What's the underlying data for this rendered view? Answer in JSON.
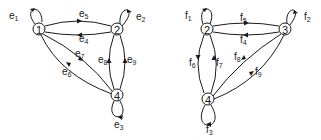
{
  "diagram": {
    "left_graph": {
      "nodes": [
        {
          "id": "1",
          "label": "1"
        },
        {
          "id": "2",
          "label": "2"
        },
        {
          "id": "4",
          "label": "4"
        }
      ],
      "edges": [
        {
          "id": "e1",
          "letter": "e",
          "sub": "1",
          "from": "1",
          "to": "1"
        },
        {
          "id": "e2",
          "letter": "e",
          "sub": "2",
          "from": "2",
          "to": "2"
        },
        {
          "id": "e3",
          "letter": "e",
          "sub": "3",
          "from": "4",
          "to": "4"
        },
        {
          "id": "e4",
          "letter": "e",
          "sub": "4",
          "from": "2",
          "to": "1"
        },
        {
          "id": "e5",
          "letter": "e",
          "sub": "5",
          "from": "1",
          "to": "2"
        },
        {
          "id": "e6",
          "letter": "e",
          "sub": "6",
          "from": "4",
          "to": "1"
        },
        {
          "id": "e7",
          "letter": "e",
          "sub": "7",
          "from": "1",
          "to": "4"
        },
        {
          "id": "e8",
          "letter": "e",
          "sub": "8",
          "from": "4",
          "to": "2"
        },
        {
          "id": "e9",
          "letter": "e",
          "sub": "9",
          "from": "4",
          "to": "2"
        }
      ]
    },
    "right_graph": {
      "nodes": [
        {
          "id": "2",
          "label": "2"
        },
        {
          "id": "3",
          "label": "3"
        },
        {
          "id": "4",
          "label": "4"
        }
      ],
      "edges": [
        {
          "id": "f1",
          "letter": "f",
          "sub": "1",
          "from": "2",
          "to": "2"
        },
        {
          "id": "f2",
          "letter": "f",
          "sub": "2",
          "from": "3",
          "to": "3"
        },
        {
          "id": "f3",
          "letter": "f",
          "sub": "3",
          "from": "4",
          "to": "4"
        },
        {
          "id": "f4",
          "letter": "f",
          "sub": "4",
          "from": "3",
          "to": "2"
        },
        {
          "id": "f5",
          "letter": "f",
          "sub": "5",
          "from": "2",
          "to": "3"
        },
        {
          "id": "f6",
          "letter": "f",
          "sub": "6",
          "from": "2",
          "to": "4"
        },
        {
          "id": "f7",
          "letter": "f",
          "sub": "7",
          "from": "4",
          "to": "2"
        },
        {
          "id": "f8",
          "letter": "f",
          "sub": "8",
          "from": "3",
          "to": "4"
        },
        {
          "id": "f9",
          "letter": "f",
          "sub": "9",
          "from": "4",
          "to": "3"
        }
      ]
    }
  }
}
